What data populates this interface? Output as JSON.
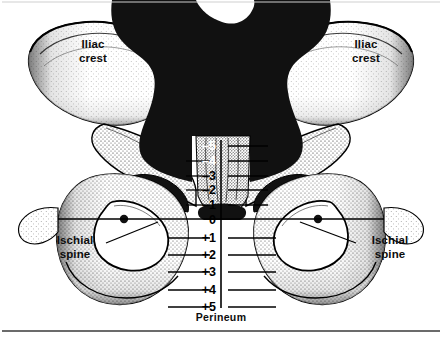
{
  "figure": {
    "type": "anatomical-diagram",
    "view": "anterior",
    "style": "black-and-white stippled line art",
    "width": 442,
    "height": 344
  },
  "labels": {
    "iliac_crest_left": "Iliac\ncrest",
    "iliac_crest_right": "Iliac\ncrest",
    "ischial_spine_left": "Ischial\nspine",
    "ischial_spine_right": "Ischial\nspine",
    "perineum": "Perineum"
  },
  "scale": {
    "name": "fetal-station-scale",
    "unit": "cm",
    "zero_label": "0",
    "zero_meaning": "level of the ischial spines",
    "ticks": [
      {
        "label": "–5",
        "value": -5,
        "y": 146
      },
      {
        "label": "–4",
        "value": -4,
        "y": 161
      },
      {
        "label": "–3",
        "value": -3,
        "y": 176
      },
      {
        "label": "–2",
        "value": -2,
        "y": 190
      },
      {
        "label": "–1",
        "value": -1,
        "y": 205
      },
      {
        "label": "0",
        "value": 0,
        "y": 220
      },
      {
        "label": "+1",
        "value": 1,
        "y": 238
      },
      {
        "label": "+2",
        "value": 2,
        "y": 255
      },
      {
        "label": "+3",
        "value": 3,
        "y": 272
      },
      {
        "label": "+4",
        "value": 4,
        "y": 290
      },
      {
        "label": "+5",
        "value": 5,
        "y": 307
      }
    ]
  },
  "colors": {
    "ink": "#000000",
    "paper": "#ffffff",
    "solid_fill": "#111111",
    "stipple": "#2b2b2b",
    "frame": "#3a3a3a"
  }
}
